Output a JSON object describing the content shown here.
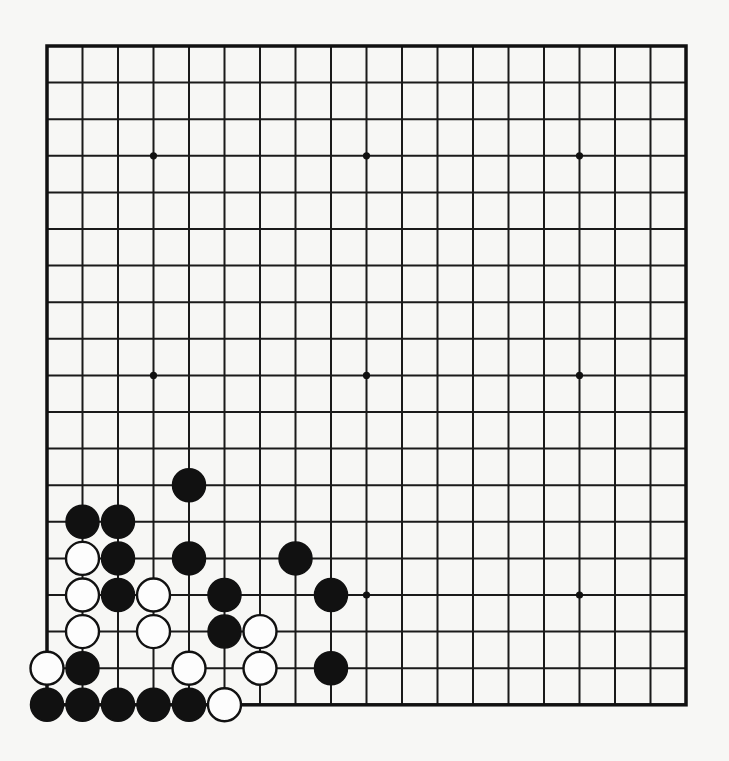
{
  "board": {
    "size": 19,
    "origin_x": 47,
    "origin_y": 46,
    "spacing_x": 35.5,
    "spacing_y": 36.6,
    "stone_radius": 16.5,
    "star_radius": 3.6,
    "colors": {
      "background": "#f7f7f5",
      "line": "#1a1a1a",
      "black_stone": "#111111",
      "white_stone": "#fdfdfd"
    },
    "star_points": [
      [
        3,
        3
      ],
      [
        9,
        3
      ],
      [
        15,
        3
      ],
      [
        3,
        9
      ],
      [
        9,
        9
      ],
      [
        15,
        9
      ],
      [
        3,
        15
      ],
      [
        9,
        15
      ],
      [
        15,
        15
      ]
    ],
    "stones": [
      {
        "color": "black",
        "col": 4,
        "row": 12
      },
      {
        "color": "black",
        "col": 1,
        "row": 13
      },
      {
        "color": "black",
        "col": 2,
        "row": 13
      },
      {
        "color": "white",
        "col": 1,
        "row": 14
      },
      {
        "color": "black",
        "col": 2,
        "row": 14
      },
      {
        "color": "black",
        "col": 4,
        "row": 14
      },
      {
        "color": "black",
        "col": 7,
        "row": 14
      },
      {
        "color": "white",
        "col": 1,
        "row": 15
      },
      {
        "color": "black",
        "col": 2,
        "row": 15
      },
      {
        "color": "white",
        "col": 3,
        "row": 15
      },
      {
        "color": "black",
        "col": 5,
        "row": 15
      },
      {
        "color": "black",
        "col": 8,
        "row": 15
      },
      {
        "color": "white",
        "col": 1,
        "row": 16
      },
      {
        "color": "white",
        "col": 3,
        "row": 16
      },
      {
        "color": "black",
        "col": 5,
        "row": 16
      },
      {
        "color": "white",
        "col": 6,
        "row": 16
      },
      {
        "color": "white",
        "col": 0,
        "row": 17
      },
      {
        "color": "black",
        "col": 1,
        "row": 17
      },
      {
        "color": "white",
        "col": 4,
        "row": 17
      },
      {
        "color": "white",
        "col": 6,
        "row": 17
      },
      {
        "color": "black",
        "col": 8,
        "row": 17
      },
      {
        "color": "black",
        "col": 0,
        "row": 18
      },
      {
        "color": "black",
        "col": 1,
        "row": 18
      },
      {
        "color": "black",
        "col": 2,
        "row": 18
      },
      {
        "color": "black",
        "col": 3,
        "row": 18
      },
      {
        "color": "black",
        "col": 4,
        "row": 18
      },
      {
        "color": "white",
        "col": 5,
        "row": 18
      }
    ]
  },
  "summary": {
    "title": "Go problem diagram (19x19, lower-left corner)",
    "black_count": "15",
    "white_count": "12"
  }
}
